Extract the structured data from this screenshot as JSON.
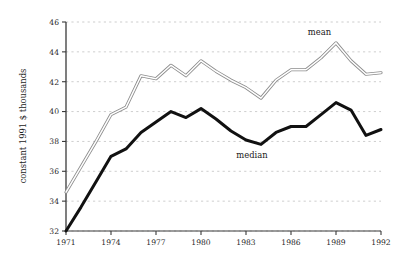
{
  "chart_data": {
    "type": "line",
    "title": "",
    "xlabel": "",
    "ylabel": "constant 1991 $ thousands",
    "xlim": [
      1971,
      1992
    ],
    "ylim": [
      32,
      46
    ],
    "grid": "horizontal dashed",
    "legend_position": "inline annotations near curves",
    "x": [
      1971,
      1972,
      1973,
      1974,
      1975,
      1976,
      1977,
      1978,
      1979,
      1980,
      1981,
      1982,
      1983,
      1984,
      1985,
      1986,
      1987,
      1988,
      1989,
      1990,
      1991,
      1992
    ],
    "xticks": [
      1971,
      1974,
      1977,
      1980,
      1983,
      1986,
      1989,
      1992
    ],
    "xtick_labels": [
      "1971",
      "1974",
      "1977",
      "1980",
      "1983",
      "1986",
      "1989",
      "1992"
    ],
    "yticks": [
      32,
      34,
      36,
      38,
      40,
      42,
      44,
      46
    ],
    "ytick_labels": [
      "32",
      "34",
      "36",
      "38",
      "40",
      "42",
      "44",
      "46"
    ],
    "series": [
      {
        "name": "mean",
        "label": "mean",
        "color": "#8c8c8c",
        "style": "thin double-stroke grey line",
        "values": [
          34.6,
          36.3,
          38.0,
          39.8,
          40.3,
          42.4,
          42.2,
          43.1,
          42.4,
          43.4,
          42.7,
          42.1,
          41.6,
          40.9,
          42.1,
          42.8,
          42.8,
          43.6,
          44.6,
          43.4,
          42.5,
          42.6
        ]
      },
      {
        "name": "median",
        "label": "median",
        "color": "#111111",
        "style": "thick black line",
        "values": [
          32.0,
          33.6,
          35.3,
          37.0,
          37.5,
          38.6,
          39.3,
          40.0,
          39.6,
          40.2,
          39.5,
          38.7,
          38.1,
          37.8,
          38.6,
          39.0,
          39.0,
          39.8,
          40.6,
          40.1,
          38.4,
          38.8
        ]
      }
    ],
    "annotations": [
      {
        "text": "mean",
        "x": 1987.9,
        "y": 45.1
      },
      {
        "text": "median",
        "x": 1983.4,
        "y": 36.9
      }
    ]
  }
}
